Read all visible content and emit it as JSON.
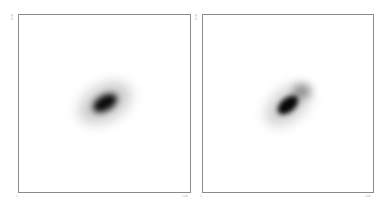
{
  "panels": [
    {
      "id": "left",
      "x_tick_min": "1",
      "x_tick_max": "128",
      "y_tick_max": "128",
      "blob": {
        "cx": 86,
        "cy": 88,
        "core_rx": 13,
        "core_ry": 7.5,
        "halo_rx": 28,
        "halo_ry": 17,
        "angle_deg": -30,
        "color": "#000000"
      }
    },
    {
      "id": "right",
      "x_tick_min": "1",
      "x_tick_max": "128",
      "y_tick_max": "128",
      "blob": {
        "cx": 85,
        "cy": 90,
        "core_rx": 12,
        "core_ry": 7,
        "halo_rx": 26,
        "halo_ry": 15,
        "angle_deg": -40,
        "extension": {
          "dx": 14,
          "dy": -14,
          "rx": 9,
          "ry": 7
        },
        "color": "#000000"
      }
    }
  ],
  "colors": {
    "frame": "#8a8a8a",
    "background": "#ffffff",
    "tick_text": "#b0b0b0"
  }
}
